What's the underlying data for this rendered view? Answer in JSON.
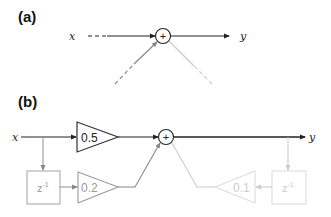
{
  "panels": {
    "a": {
      "label": "(a)",
      "input_label": "x",
      "output_label": "y",
      "sum_symbol": "+"
    },
    "b": {
      "label": "(b)",
      "input_label": "x",
      "output_label": "y",
      "sum_symbol": "+",
      "gains": [
        {
          "id": "b0",
          "value": "0.5",
          "color": "#333333"
        },
        {
          "id": "b1",
          "value": "0.2",
          "color": "#999999"
        },
        {
          "id": "a1",
          "value": "0.1",
          "color": "#cccccc"
        }
      ],
      "delays": [
        {
          "id": "input-delay",
          "base": "z",
          "exp": "-1",
          "color": "#aaaaaa"
        },
        {
          "id": "output-delay",
          "base": "z",
          "exp": "-1",
          "color": "#cccccc"
        }
      ]
    }
  },
  "colors": {
    "main": "#222222",
    "feedforward": "#888888",
    "feedback": "#cccccc"
  }
}
